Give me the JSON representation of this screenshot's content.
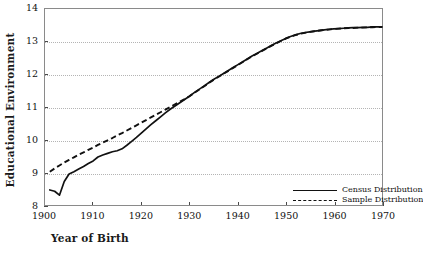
{
  "chart_data": {
    "type": "line",
    "title": "",
    "xlabel": "Year of Birth",
    "ylabel": "Educational Environment",
    "xlim": [
      1900,
      1970
    ],
    "ylim": [
      8,
      14
    ],
    "xticks": [
      1900,
      1910,
      1920,
      1930,
      1940,
      1950,
      1960,
      1970
    ],
    "yticks": [
      8,
      9,
      10,
      11,
      12,
      13,
      14
    ],
    "grid": "horizontal-dotted",
    "legend_position": "inside lower-right",
    "series": [
      {
        "name": "Census Distribution",
        "style": "solid",
        "color": "#111111",
        "x": [
          1901,
          1902,
          1903,
          1904,
          1905,
          1906,
          1907,
          1908,
          1909,
          1910,
          1911,
          1912,
          1913,
          1914,
          1915,
          1916,
          1917,
          1918,
          1919,
          1920,
          1921,
          1922,
          1923,
          1924,
          1925,
          1926,
          1927,
          1928,
          1929,
          1930,
          1931,
          1932,
          1933,
          1934,
          1935,
          1936,
          1937,
          1938,
          1939,
          1940,
          1941,
          1942,
          1943,
          1944,
          1945,
          1946,
          1947,
          1948,
          1949,
          1950,
          1951,
          1952,
          1953,
          1954,
          1955,
          1956,
          1957,
          1958,
          1959,
          1960,
          1961,
          1962,
          1963,
          1964,
          1965,
          1966,
          1967,
          1968,
          1969,
          1970
        ],
        "y": [
          8.46,
          8.42,
          8.3,
          8.72,
          8.95,
          9.02,
          9.1,
          9.18,
          9.27,
          9.35,
          9.47,
          9.53,
          9.58,
          9.63,
          9.66,
          9.72,
          9.83,
          9.95,
          10.07,
          10.2,
          10.33,
          10.46,
          10.58,
          10.7,
          10.82,
          10.93,
          11.03,
          11.13,
          11.23,
          11.33,
          11.44,
          11.54,
          11.64,
          11.74,
          11.84,
          11.93,
          12.02,
          12.11,
          12.2,
          12.29,
          12.38,
          12.47,
          12.56,
          12.64,
          12.72,
          12.8,
          12.88,
          12.96,
          13.03,
          13.1,
          13.16,
          13.21,
          13.25,
          13.28,
          13.3,
          13.32,
          13.34,
          13.36,
          13.38,
          13.39,
          13.4,
          13.41,
          13.42,
          13.43,
          13.43,
          13.44,
          13.44,
          13.45,
          13.45,
          13.45
        ]
      },
      {
        "name": "Sample Distribution",
        "style": "dashed",
        "color": "#111111",
        "x": [
          1901,
          1902,
          1903,
          1904,
          1905,
          1906,
          1907,
          1908,
          1909,
          1910,
          1911,
          1912,
          1913,
          1914,
          1915,
          1916,
          1917,
          1918,
          1919,
          1920,
          1921,
          1922,
          1923,
          1924,
          1925,
          1926,
          1927,
          1928,
          1929,
          1930,
          1931,
          1932,
          1933,
          1934,
          1935,
          1936,
          1937,
          1938,
          1939,
          1940,
          1941,
          1942,
          1943,
          1944,
          1945,
          1946,
          1947,
          1948,
          1949,
          1950,
          1951,
          1952,
          1953,
          1954,
          1955,
          1956,
          1957,
          1958,
          1959,
          1960,
          1961,
          1962,
          1963,
          1964,
          1965,
          1966,
          1967,
          1968,
          1969,
          1970
        ],
        "y": [
          9.02,
          9.12,
          9.21,
          9.3,
          9.38,
          9.46,
          9.54,
          9.61,
          9.69,
          9.76,
          9.84,
          9.91,
          9.98,
          10.05,
          10.13,
          10.2,
          10.28,
          10.36,
          10.44,
          10.52,
          10.6,
          10.68,
          10.76,
          10.84,
          10.92,
          11.0,
          11.08,
          11.16,
          11.24,
          11.33,
          11.43,
          11.53,
          11.63,
          11.73,
          11.83,
          11.92,
          12.01,
          12.1,
          12.19,
          12.28,
          12.37,
          12.46,
          12.55,
          12.63,
          12.71,
          12.79,
          12.87,
          12.95,
          13.02,
          13.09,
          13.15,
          13.2,
          13.24,
          13.27,
          13.3,
          13.32,
          13.34,
          13.36,
          13.37,
          13.39,
          13.4,
          13.41,
          13.42,
          13.42,
          13.43,
          13.43,
          13.44,
          13.44,
          13.45,
          13.45
        ]
      }
    ]
  },
  "legend": {
    "items": [
      {
        "label": "Census Distribution",
        "style": "solid"
      },
      {
        "label": "Sample Distribution",
        "style": "dashed"
      }
    ]
  },
  "axes": {
    "x_title": "Year of Birth",
    "y_title": "Educational Environment"
  }
}
